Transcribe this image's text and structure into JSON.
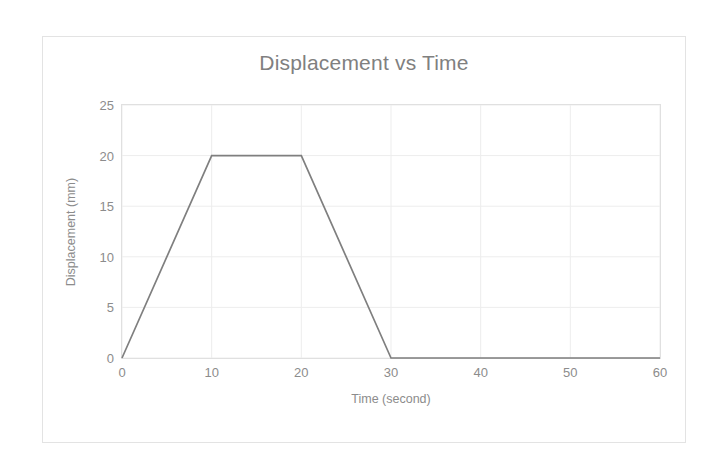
{
  "chart_data": {
    "type": "line",
    "title": "Displacement vs Time",
    "xlabel": "Time (second)",
    "ylabel": "Displacement (mm)",
    "xlim": [
      0,
      60
    ],
    "ylim": [
      0,
      25
    ],
    "xticks": [
      0,
      10,
      20,
      30,
      40,
      50,
      60
    ],
    "yticks": [
      0,
      5,
      10,
      15,
      20,
      25
    ],
    "grid": true,
    "legend": "none",
    "series": [
      {
        "name": "Displacement",
        "color": "#7f7f7f",
        "x": [
          0,
          10,
          20,
          30,
          60
        ],
        "y": [
          0,
          20,
          20,
          0,
          0
        ]
      }
    ]
  },
  "style": {
    "title_color": "#808080",
    "axis_label_color": "#8c8c8c",
    "tick_color": "#8c8c8c",
    "grid_color": "#ededed",
    "plot_border_color": "#e0e0e0",
    "frame_border_color": "#e3e3e3",
    "background": "#ffffff"
  }
}
